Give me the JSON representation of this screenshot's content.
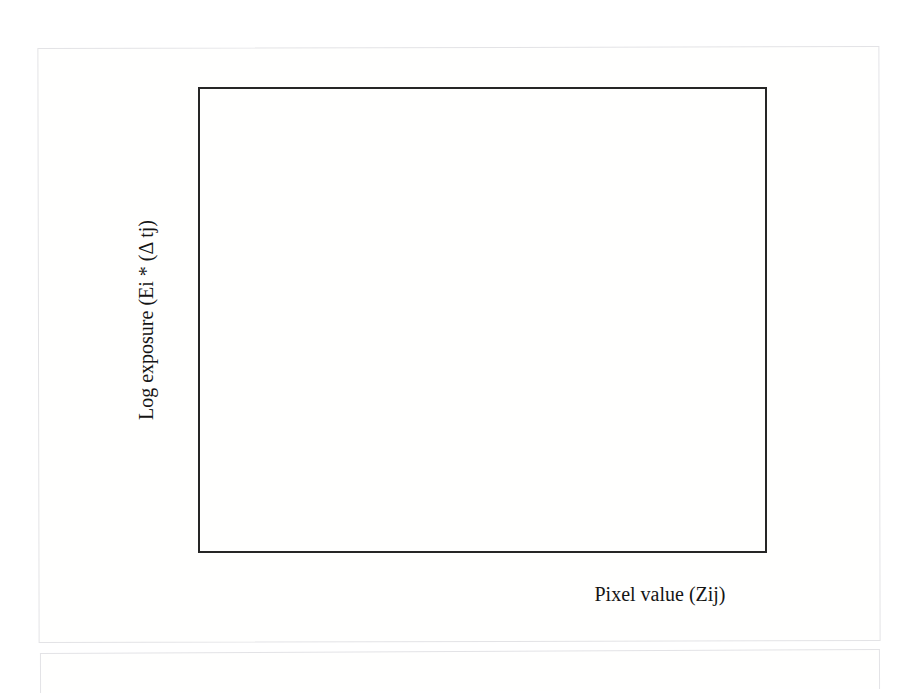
{
  "figure": {
    "xlabel": "Pixel value (Zij)",
    "ylabel": "Log exposure (Ei * (Δ tj)"
  },
  "chart_data": {
    "type": "scatter",
    "title": "",
    "xlabel": "Pixel value (Zij)",
    "ylabel": "Log exposure (Ei * (Δ tj)",
    "xlim": [
      0,
      300
    ],
    "ylim": [
      -6,
      6
    ],
    "xticks": [
      0,
      50,
      100,
      150,
      200,
      250,
      300
    ],
    "yticks": [
      -6,
      -4,
      -2,
      0,
      2,
      4,
      6
    ],
    "xtick_labels": [
      "0",
      "50",
      "100",
      "150",
      "200",
      "250",
      "300"
    ],
    "ytick_labels": [
      "-6",
      "-4",
      "-2",
      "0",
      "2",
      "4",
      "6"
    ],
    "grid": false,
    "legend": false,
    "tick_direction": "in",
    "frame": "box",
    "series": [
      {
        "name": "cross-series",
        "marker": "x",
        "color": "#2b2b2b",
        "points": [
          {
            "x": 24,
            "y": -3.3
          },
          {
            "x": 31,
            "y": -2.57
          },
          {
            "x": 47,
            "y": -1.87
          },
          {
            "x": 55,
            "y": -1.52
          },
          {
            "x": 68,
            "y": -1.17
          },
          {
            "x": 100,
            "y": -0.45
          }
        ]
      },
      {
        "name": "plus-series",
        "marker": "+",
        "color": "#2b2b2b",
        "points": [
          {
            "x": 52,
            "y": -1.62
          },
          {
            "x": 61,
            "y": -1.35
          },
          {
            "x": 84,
            "y": -0.75
          },
          {
            "x": 118,
            "y": -0.08
          },
          {
            "x": 165,
            "y": 0.63
          },
          {
            "x": 220,
            "y": 1.35
          }
        ]
      },
      {
        "name": "circle-series",
        "marker": "o",
        "color": "#4a4a52",
        "points": [
          {
            "x": 152,
            "y": 0.45
          },
          {
            "x": 205,
            "y": 1.15
          },
          {
            "x": 254,
            "y": 1.88
          },
          {
            "x": 254,
            "y": 2.6
          },
          {
            "x": 254,
            "y": 3.3
          }
        ]
      }
    ]
  }
}
